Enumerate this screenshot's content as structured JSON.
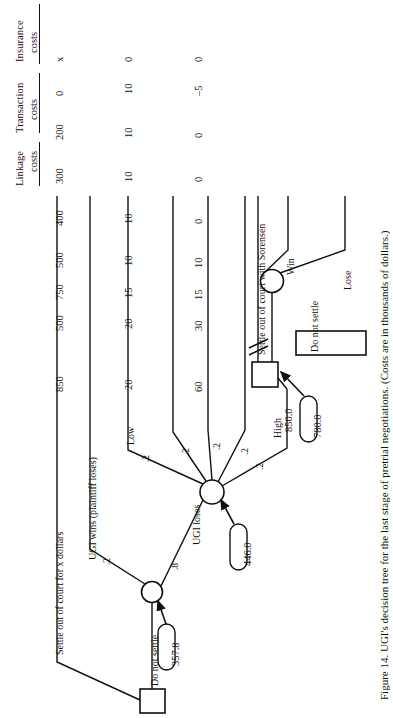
{
  "figure": {
    "caption": "Figure 14. UGI's decision tree for the last stage of pretrial negotiations. (Costs are in thousands of dollars.)",
    "orientation": "rotated-90-ccw"
  },
  "table": {
    "columns": [
      {
        "id": "insurance",
        "line1": "Insurance",
        "line2": "costs"
      },
      {
        "id": "transaction",
        "line1": "Transaction",
        "line2": "costs"
      },
      {
        "id": "linkage",
        "line1": "Linkage",
        "line2": "costs"
      }
    ],
    "rows": [
      {
        "insurance": "x",
        "transaction": "0",
        "linkage": "0"
      },
      {
        "insurance": "0",
        "transaction": "10",
        "linkage": "–5"
      },
      {
        "insurance": "200",
        "transaction": "10",
        "linkage": "0"
      },
      {
        "insurance": "300",
        "transaction": "10",
        "linkage": "0"
      },
      {
        "insurance": "400",
        "transaction": "10",
        "linkage": "0"
      },
      {
        "insurance": "500",
        "transaction": "10",
        "linkage": "10"
      },
      {
        "insurance": "750",
        "transaction": "15",
        "linkage": "15"
      },
      {
        "insurance": "500",
        "transaction": "20",
        "linkage": "30"
      },
      {
        "insurance": "850",
        "transaction": "20",
        "linkage": "60"
      }
    ]
  },
  "tree": {
    "branch_labels": {
      "settle_x": "Settle out of court for x dollars",
      "ugi_wins": "UGI wins (plaintiff loses)",
      "low": "Low",
      "ugi_loses": "UGI loses",
      "high": "High",
      "settle_sorensen": "Settle out of court with Sorensen",
      "win": "Win",
      "lose": "Lose",
      "do_not_settle_root": "Do not settle",
      "do_not_settle_2": "Do not settle"
    },
    "probabilities": {
      "ugi_wins": ".2",
      "ugi_loses": ".8",
      "low": ".2",
      "mid1": ".2",
      "mid2": ".2",
      "mid3": ".2",
      "high": ".2"
    },
    "values": {
      "root_ev": "357.8",
      "chance2_ev": "446.0",
      "high_branch": "850.0",
      "decision_ev": "780.0"
    }
  }
}
